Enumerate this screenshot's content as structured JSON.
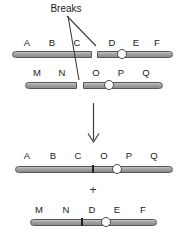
{
  "diagram": {
    "breaks_label": "Breaks",
    "plus_sign": "+",
    "rows": [
      {
        "name": "chromosome-1-with-break",
        "letters": [
          "A",
          "B",
          "C",
          "D",
          "E",
          "F"
        ],
        "break_between": [
          "C",
          "D"
        ],
        "centromere_between": [
          "D",
          "E"
        ]
      },
      {
        "name": "chromosome-2-with-break",
        "letters": [
          "M",
          "N",
          "O",
          "P",
          "Q"
        ],
        "break_between": [
          "N",
          "O"
        ],
        "centromere_between": [
          "O",
          "P"
        ]
      },
      {
        "name": "derivative-chromosome-1",
        "letters": [
          "A",
          "B",
          "C",
          "O",
          "P",
          "Q"
        ],
        "junction_between": [
          "C",
          "O"
        ],
        "centromere_between": [
          "O",
          "P"
        ]
      },
      {
        "name": "derivative-chromosome-2",
        "letters": [
          "M",
          "N",
          "D",
          "E",
          "F"
        ],
        "junction_between": [
          "N",
          "D"
        ],
        "centromere_between": [
          "D",
          "E"
        ]
      }
    ],
    "colors": {
      "bar_fill": "#a0a0a0",
      "bar_border": "#575757",
      "centromere_fill": "#ffffff",
      "annotation_line": "#3c3c3c",
      "text": "#1a1a1a"
    }
  }
}
